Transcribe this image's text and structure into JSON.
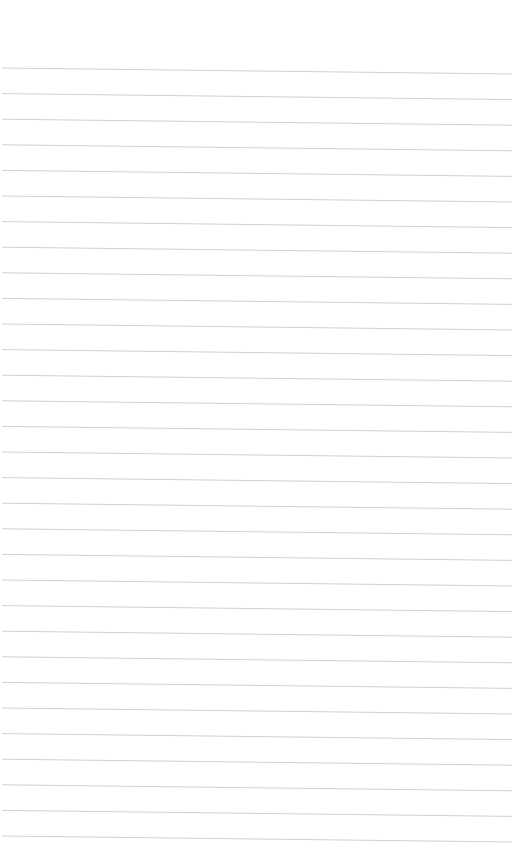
{
  "page": {
    "type": "lined-paper",
    "background_color": "#ffffff",
    "line_color": "#c9c9c9",
    "line_count": 31,
    "first_line_y": 68,
    "line_spacing": 25.6,
    "slope_px": 6,
    "text": ""
  }
}
